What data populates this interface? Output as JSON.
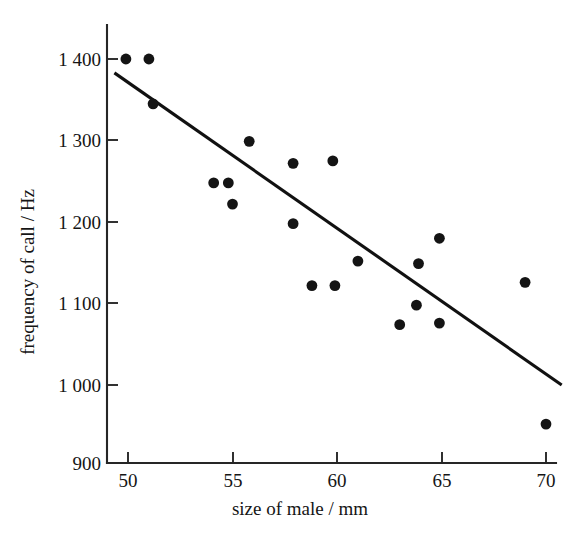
{
  "chart_data": {
    "type": "scatter",
    "title": "",
    "xlabel": "size of male / mm",
    "ylabel": "frequency of call / Hz",
    "xlim": [
      49,
      71
    ],
    "ylim": [
      900,
      1425
    ],
    "grid": false,
    "legend": null,
    "xticks": [
      50,
      55,
      60,
      65,
      70
    ],
    "xtick_labels": [
      "50",
      "55",
      "60",
      "65",
      "70"
    ],
    "yticks": [
      900,
      1000,
      1100,
      1200,
      1300,
      1400
    ],
    "ytick_labels": [
      "900",
      "1 000",
      "1 100",
      "1 200",
      "1 300",
      "1 400"
    ],
    "point_color": "#141414",
    "line_color": "#111111",
    "axis_color": "#262626",
    "points": [
      {
        "x": 49.9,
        "y": 1400
      },
      {
        "x": 51.0,
        "y": 1400
      },
      {
        "x": 51.2,
        "y": 1345
      },
      {
        "x": 54.1,
        "y": 1248
      },
      {
        "x": 54.8,
        "y": 1248
      },
      {
        "x": 55.0,
        "y": 1222
      },
      {
        "x": 55.8,
        "y": 1299
      },
      {
        "x": 57.9,
        "y": 1272
      },
      {
        "x": 57.9,
        "y": 1198
      },
      {
        "x": 59.8,
        "y": 1275
      },
      {
        "x": 58.8,
        "y": 1122
      },
      {
        "x": 59.9,
        "y": 1122
      },
      {
        "x": 61.0,
        "y": 1152
      },
      {
        "x": 63.0,
        "y": 1074
      },
      {
        "x": 63.8,
        "y": 1098
      },
      {
        "x": 63.9,
        "y": 1149
      },
      {
        "x": 64.9,
        "y": 1180
      },
      {
        "x": 64.9,
        "y": 1076
      },
      {
        "x": 69.0,
        "y": 1126
      },
      {
        "x": 70.0,
        "y": 952
      }
    ],
    "trend_line": {
      "x_start": 49.35,
      "y_start": 1383,
      "x_end": 70.75,
      "y_end": 1000
    }
  }
}
